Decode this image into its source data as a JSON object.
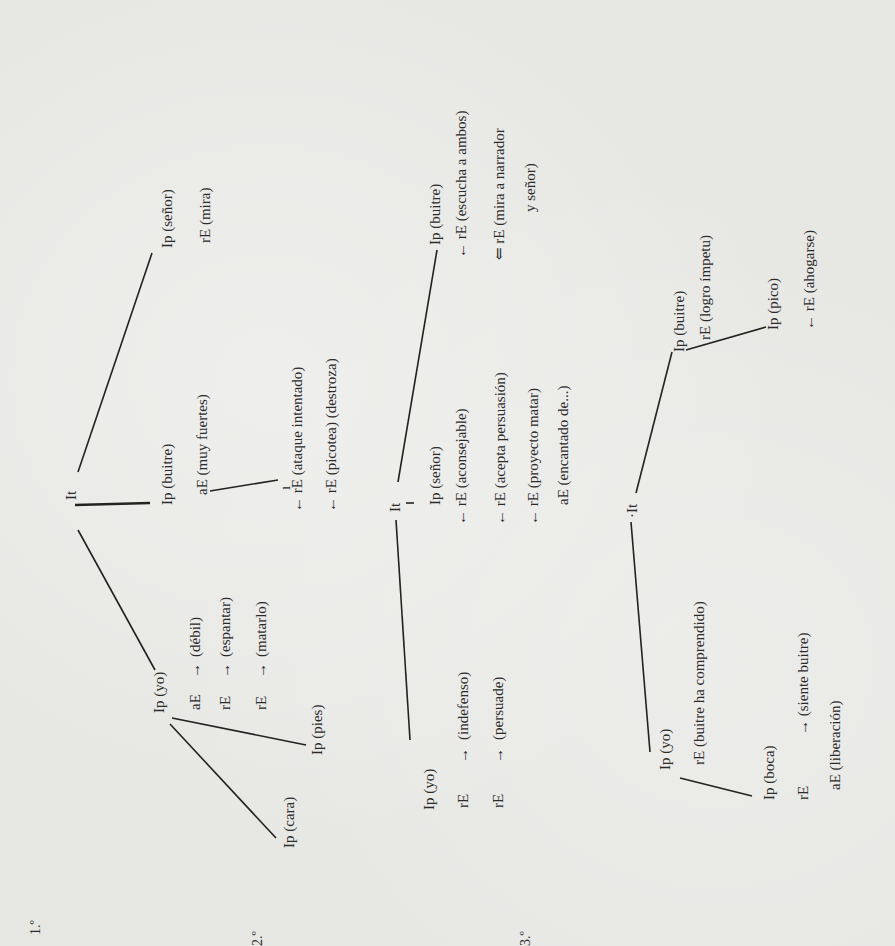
{
  "sections": [
    {
      "label": "1.º",
      "root": "It",
      "nodes": {
        "senor": "Ip (señor)",
        "senor_mira": "rE (mira)",
        "buitre": "Ip (buitre)",
        "buitre_fuertes": "aE (muy fuertes)",
        "ataque": "← rE (ataque intentado)",
        "picotea": "← rE (picotea) (destroza)",
        "yo": "Ip (yo)",
        "debil_prefix": "aE",
        "debil": "(débil)",
        "espantar_prefix": "rE",
        "espantar": "(espantar)",
        "matarlo_prefix": "rE",
        "matarlo": "(matarlo)",
        "pies": "Ip (pies)",
        "cara": "Ip (cara)"
      }
    },
    {
      "label": "2.º",
      "root": "It",
      "nodes": {
        "buitre": "Ip (buitre)",
        "escucha": "← rE (escucha a ambos)",
        "mira1": "⇐ rE (mira a narrador",
        "mira2": "y señor)",
        "senor": "Ip (señor)",
        "aconsejable": "← rE (aconsejable)",
        "acepta": "← rE (acepta persuasión)",
        "proyecto": "← rE (proyecto matar)",
        "encantado": "aE (encantado de...)",
        "yo": "Ip (yo)",
        "indefenso_prefix": "rE",
        "indefenso": "(indefenso)",
        "persuade_prefix": "rE",
        "persuade": "(persuade)"
      }
    },
    {
      "label": "3.º",
      "root": "·It",
      "nodes": {
        "buitre": "Ip (buitre)",
        "logro": "rE (logro ímpetu)",
        "pico": "Ip (pico)",
        "ahogarse": "← rE (ahogarse)",
        "yo": "Ip (yo)",
        "comprendido": "rE (buitre ha comprendido)",
        "boca": "Ip (boca)",
        "siente_prefix": "rE",
        "siente": "→ (siente buitre)",
        "liberacion": "aE (liberación)"
      }
    }
  ],
  "arrow_right": "→"
}
